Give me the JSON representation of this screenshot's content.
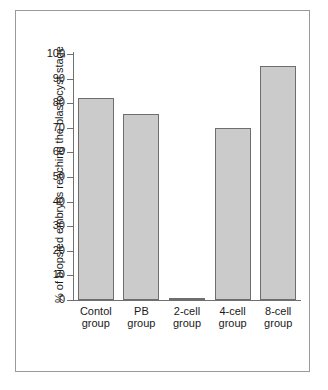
{
  "chart_data": {
    "type": "bar",
    "title": "",
    "subtitle": "",
    "xlabel": "",
    "ylabel": "% of biopsied embryos reaching the blastocyst stage",
    "ylim": [
      0,
      100
    ],
    "ytick_step": 10,
    "yticks": [
      100,
      90,
      80,
      70,
      60,
      50,
      40,
      30,
      20,
      10,
      0
    ],
    "ytick_labels": [
      "100",
      "90",
      "80",
      "70",
      "60",
      "50",
      "40",
      "30",
      "20",
      "10",
      "0"
    ],
    "grid": false,
    "legend": false,
    "legend_position": "none",
    "categories": [
      "Contol group",
      "PB group",
      "2-cell group",
      "4-cell group",
      "8-cell group"
    ],
    "category_lines": [
      [
        "Contol",
        "group"
      ],
      [
        "PB",
        "group"
      ],
      [
        "2-cell",
        "group"
      ],
      [
        "4-cell",
        "group"
      ],
      [
        "8-cell",
        "group"
      ]
    ],
    "values": [
      82,
      75.5,
      1,
      70,
      95
    ],
    "bar_fill_color": "#cbcbcb",
    "bar_border_color": "#6e6e6e",
    "axis_color": "#707070",
    "background_color": "#ffffff",
    "frame_border_color": "#9a9a9a"
  }
}
